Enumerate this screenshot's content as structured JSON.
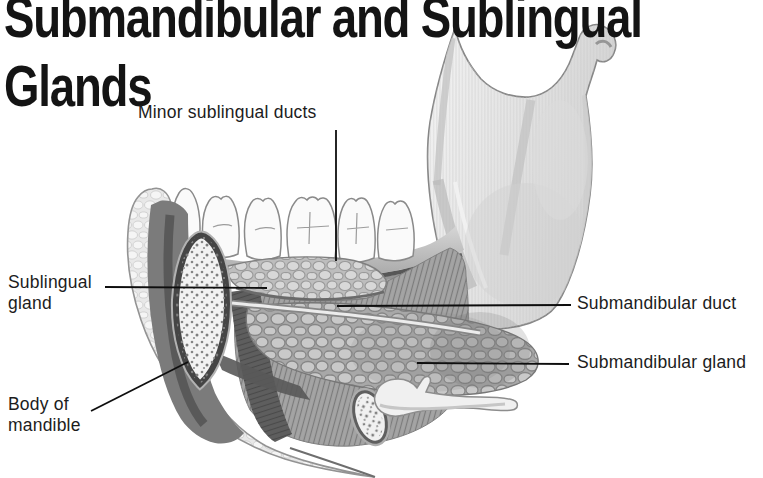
{
  "page": {
    "background_color": "#ffffff",
    "text_color": "#1a1a1a"
  },
  "title": {
    "line1": "Submandibular and Sublingual",
    "line2": "Glands"
  },
  "figure": {
    "labels": [
      {
        "text": "Minor sublingual ducts"
      },
      {
        "text": "Sublingual gland"
      },
      {
        "text": "Body of mandible"
      },
      {
        "text": "Submandibular duct"
      },
      {
        "text": "Submandibular gland"
      }
    ]
  }
}
